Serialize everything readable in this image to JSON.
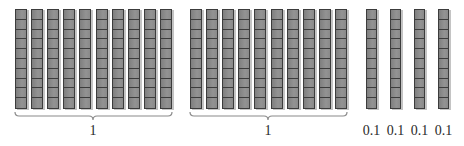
{
  "diagram": {
    "title": "",
    "colors": {
      "rod_fill": "#8c8c8c",
      "rod_line": "#3c3c3c",
      "rod_shadow": "#c4c4c4",
      "brace": "#8a8a8a",
      "label": "#2a2a2a"
    },
    "cells_per_rod": 10,
    "groups": [
      {
        "id": "group-1",
        "label": "1",
        "rod_count": 10,
        "x_start": 15,
        "pitch": 16.1,
        "rod_width": 12,
        "brace": {
          "x1": 15,
          "x2": 172,
          "tip_x": 93
        }
      },
      {
        "id": "group-2",
        "label": "1",
        "rod_count": 10,
        "x_start": 190,
        "pitch": 16.1,
        "rod_width": 12,
        "brace": {
          "x1": 190,
          "x2": 347,
          "tip_x": 268
        }
      }
    ],
    "singles": [
      {
        "id": "tenth-1",
        "label": "0.1",
        "x": 366
      },
      {
        "id": "tenth-2",
        "label": "0.1",
        "x": 390
      },
      {
        "id": "tenth-3",
        "label": "0.1",
        "x": 414
      },
      {
        "id": "tenth-4",
        "label": "0.1",
        "x": 438
      }
    ],
    "rod_top": 9,
    "rod_height": 100,
    "single_width": 11
  }
}
